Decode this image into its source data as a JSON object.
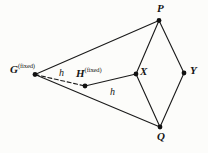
{
  "figure": {
    "kind": "geometry-diagram",
    "background_color": "#fcfcfa",
    "stroke_color": "#1a1a1a",
    "vertices": [
      {
        "id": "P",
        "label": "P",
        "x": 159,
        "y": 20.5,
        "dot": true
      },
      {
        "id": "Q",
        "label": "Q",
        "x": 160,
        "y": 127,
        "dot": true
      },
      {
        "id": "X",
        "label": "X",
        "x": 136,
        "y": 74,
        "dot": true
      },
      {
        "id": "Y",
        "label": "Y",
        "x": 184,
        "y": 73,
        "dot": true
      },
      {
        "id": "G",
        "label": "G",
        "superscript": "(fixed)",
        "x": 35,
        "y": 74.5,
        "dot": true
      },
      {
        "id": "H",
        "label": "H",
        "superscript": "(fixed)",
        "x": 85,
        "y": 86,
        "dot": true
      }
    ],
    "edges": [
      {
        "from": "G",
        "to": "P",
        "style": "solid"
      },
      {
        "from": "G",
        "to": "Q",
        "style": "solid"
      },
      {
        "from": "G",
        "to": "H",
        "style": "dashed"
      },
      {
        "from": "H",
        "to": "X",
        "style": "solid"
      },
      {
        "from": "P",
        "to": "X",
        "style": "solid"
      },
      {
        "from": "X",
        "to": "Q",
        "style": "solid"
      },
      {
        "from": "P",
        "to": "Y",
        "style": "solid"
      },
      {
        "from": "Y",
        "to": "Q",
        "style": "solid"
      }
    ],
    "segment_labels": [
      {
        "id": "h1",
        "text": "h",
        "for_edge": "G-H"
      },
      {
        "id": "h2",
        "text": "h",
        "for_edge": "H-X"
      }
    ],
    "superscript_text": "(fixed)"
  }
}
